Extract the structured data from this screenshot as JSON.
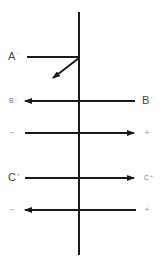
{
  "diagram": {
    "type": "charge-direction schematic",
    "vertical_axis": {
      "x": 79,
      "y1": 12,
      "y2": 255
    },
    "rows": [
      {
        "id": "A",
        "y": 57,
        "left_label": {
          "text": "A",
          "sup": "−"
        },
        "line": {
          "x1": 27,
          "x2": 79
        },
        "arrow": {
          "from": [
            79,
            57
          ],
          "to": [
            52,
            78
          ],
          "direction": "down-left"
        }
      },
      {
        "id": "B",
        "y": 101,
        "left_label": {
          "text": "B",
          "sup": "−"
        },
        "right_label": {
          "text": "B",
          "sup": "−"
        },
        "arrow": {
          "from": 135,
          "to": 25,
          "direction": "left"
        }
      },
      {
        "id": "row3",
        "y": 133,
        "left_label": {
          "text": "−"
        },
        "right_label": {
          "text": "+"
        },
        "arrow": {
          "from": 25,
          "to": 134,
          "direction": "right"
        }
      },
      {
        "id": "C",
        "y": 178,
        "left_label": {
          "text": "C",
          "sup": "+"
        },
        "right_label": {
          "text": "C",
          "sup": "+"
        },
        "arrow": {
          "from": 25,
          "to": 134,
          "direction": "right"
        }
      },
      {
        "id": "row5",
        "y": 210,
        "left_label": {
          "text": "−"
        },
        "right_label": {
          "text": "+"
        },
        "arrow": {
          "from": 136,
          "to": 25,
          "direction": "left"
        }
      }
    ],
    "stroke_color": "#1a1a1a"
  }
}
